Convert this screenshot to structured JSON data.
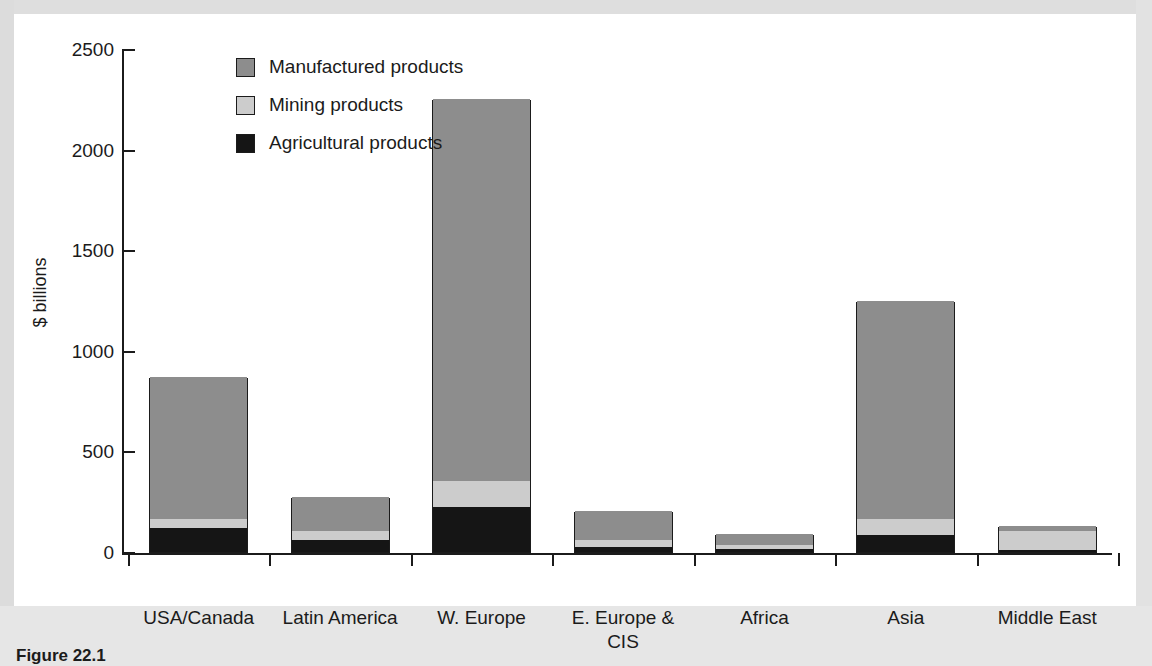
{
  "figure": {
    "caption": "Figure 22.1"
  },
  "legend": {
    "position": "top-left-inside",
    "items": [
      {
        "label": "Manufactured products",
        "swatch": "manufactured-swatch",
        "color": "#8d8d8d"
      },
      {
        "label": "Mining products",
        "swatch": "mining-swatch",
        "color": "#cccccc"
      },
      {
        "label": "Agricultural products",
        "swatch": "agricultural-swatch",
        "color": "#151515"
      }
    ]
  },
  "axes": {
    "ylabel": "$ billions",
    "yticks": [
      "0",
      "500",
      "1000",
      "1500",
      "2000",
      "2500"
    ],
    "xlabel": ""
  },
  "chart_data": {
    "type": "bar",
    "stacked": true,
    "title": "",
    "xlabel": "",
    "ylabel": "$ billions",
    "ylim": [
      0,
      2500
    ],
    "ytick_values": [
      0,
      500,
      1000,
      1500,
      2000,
      2500
    ],
    "grid": false,
    "legend_position": "top-left-inside",
    "categories": [
      "USA/Canada",
      "Latin America",
      "W. Europe",
      "E. Europe & CIS",
      "Africa",
      "Asia",
      "Middle East"
    ],
    "category_lines": [
      [
        "USA/Canada"
      ],
      [
        "Latin America"
      ],
      [
        "W. Europe"
      ],
      [
        "E. Europe &",
        "CIS"
      ],
      [
        "Africa"
      ],
      [
        "Asia"
      ],
      [
        "Middle East"
      ]
    ],
    "series": [
      {
        "name": "Agricultural products",
        "color": "#151515",
        "values": [
          120,
          60,
          225,
          25,
          15,
          85,
          10
        ]
      },
      {
        "name": "Mining products",
        "color": "#cccccc",
        "values": [
          45,
          45,
          130,
          35,
          20,
          80,
          95
        ]
      },
      {
        "name": "Manufactured products",
        "color": "#8d8d8d",
        "values": [
          705,
          170,
          1895,
          145,
          55,
          1085,
          25
        ]
      }
    ],
    "totals": [
      870,
      275,
      2250,
      205,
      90,
      1250,
      130
    ]
  }
}
